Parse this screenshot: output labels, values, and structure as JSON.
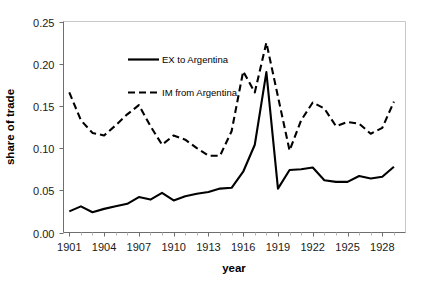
{
  "chart_data": {
    "type": "line",
    "title": "",
    "xlabel": "year",
    "ylabel": "share of trade",
    "xlim": [
      1900.5,
      1930.0
    ],
    "ylim": [
      0.0,
      0.25
    ],
    "grid": false,
    "legend_position": "upper-center-left",
    "y_ticks": [
      "0.00",
      "0.05",
      "0.10",
      "0.15",
      "0.20",
      "0.25"
    ],
    "y_tick_values": [
      0.0,
      0.05,
      0.1,
      0.15,
      0.2,
      0.25
    ],
    "x_ticks": [
      "1901",
      "1904",
      "1907",
      "1910",
      "1913",
      "1916",
      "1919",
      "1922",
      "1925",
      "1928"
    ],
    "x_tick_values": [
      1901,
      1904,
      1907,
      1910,
      1913,
      1916,
      1919,
      1922,
      1925,
      1928
    ],
    "x": [
      1901,
      1902,
      1903,
      1904,
      1905,
      1906,
      1907,
      1908,
      1909,
      1910,
      1911,
      1912,
      1913,
      1914,
      1915,
      1916,
      1917,
      1918,
      1919,
      1920,
      1921,
      1922,
      1923,
      1924,
      1925,
      1926,
      1927,
      1928,
      1929
    ],
    "series": [
      {
        "name": "EX to Argentina",
        "style": "solid",
        "color": "#000000",
        "values": [
          0.025,
          0.031,
          0.024,
          0.028,
          0.031,
          0.034,
          0.042,
          0.039,
          0.047,
          0.038,
          0.043,
          0.046,
          0.048,
          0.052,
          0.053,
          0.072,
          0.104,
          0.19,
          0.052,
          0.074,
          0.075,
          0.077,
          0.062,
          0.06,
          0.06,
          0.067,
          0.064,
          0.066,
          0.078
        ]
      },
      {
        "name": "IM from Argentina",
        "style": "dashed",
        "color": "#000000",
        "values": [
          0.166,
          0.133,
          0.118,
          0.115,
          0.127,
          0.14,
          0.151,
          0.126,
          0.104,
          0.115,
          0.11,
          0.1,
          0.091,
          0.091,
          0.12,
          0.191,
          0.166,
          0.225,
          0.161,
          0.097,
          0.133,
          0.154,
          0.147,
          0.126,
          0.131,
          0.129,
          0.117,
          0.124,
          0.155
        ]
      }
    ]
  },
  "axes": {
    "x_title": "year",
    "y_title": "share of trade"
  },
  "legend": {
    "items": [
      {
        "label": "EX to Argentina",
        "style": "solid"
      },
      {
        "label": "IM from Argentina",
        "style": "dashed"
      }
    ]
  }
}
